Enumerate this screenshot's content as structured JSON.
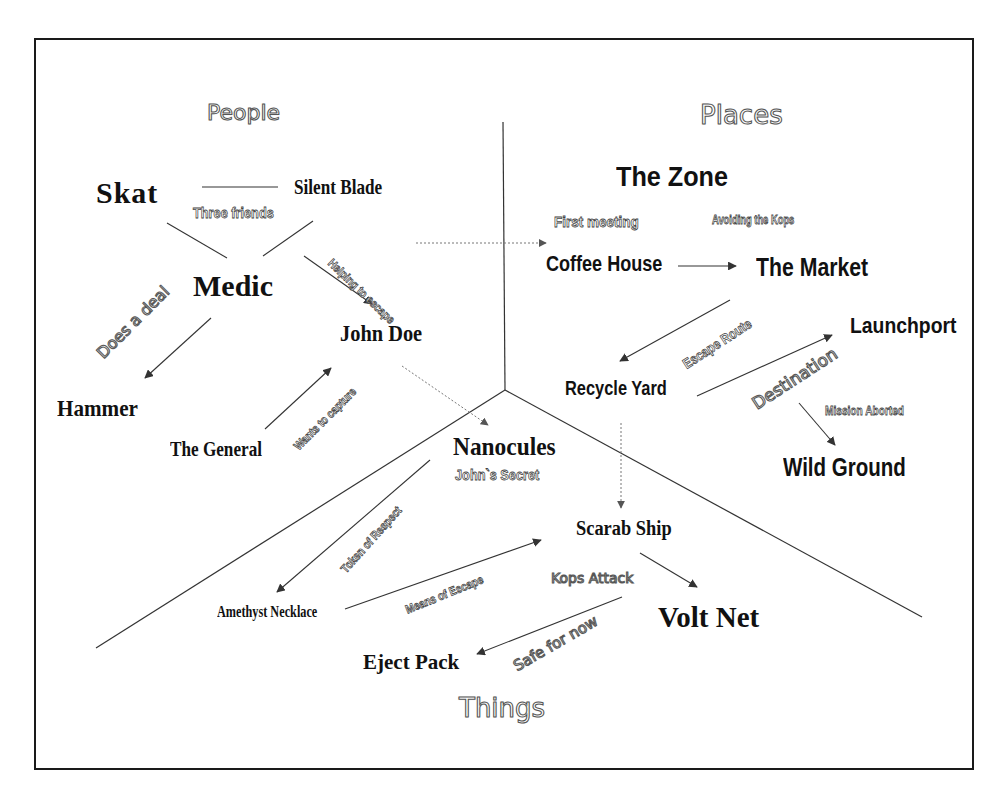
{
  "sections": {
    "people": "People",
    "places": "Places",
    "things": "Things"
  },
  "nodes": {
    "skat": "Skat",
    "silent_blade": "Silent Blade",
    "medic": "Medic",
    "john_doe": "John Doe",
    "hammer": "Hammer",
    "the_general": "The General",
    "the_zone": "The Zone",
    "coffee_house": "Coffee House",
    "the_market": "The Market",
    "launchport": "Launchport",
    "recycle_yard": "Recycle Yard",
    "wild_ground": "Wild Ground",
    "nanocules": "Nanocules",
    "scarab_ship": "Scarab Ship",
    "amethyst_necklace": "Amethyst Necklace",
    "volt_net": "Volt Net",
    "eject_pack": "Eject Pack"
  },
  "edge_labels": {
    "three_friends": "Three friends",
    "helping_to_escape": "Helping to escape",
    "does_a_deal": "Does a deal",
    "wants_to_capture": "Wants to capture",
    "first_meeting": "First meeting",
    "avoiding_the_kops": "Avoiding the Kops",
    "escape_route": "Escape Route",
    "destination": "Destination",
    "mission_aborted": "Mission Aborted",
    "johns_secret": "John`s Secret",
    "token_of_respect": "Token of Respect",
    "means_of_escape": "Means of Escape",
    "kops_attack": "Kops Attack",
    "safe_for_now": "Safe for now"
  },
  "colors": {
    "line": "#333333",
    "frame": "#1a1a1a",
    "text": "#111111",
    "outline_text": "#555555"
  }
}
